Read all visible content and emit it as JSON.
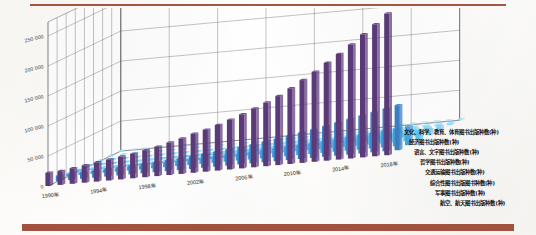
{
  "figure": {
    "title": "",
    "top_rule_color": "#9a4a31",
    "bottom_band_color": "#9e4a33"
  },
  "chart_data": {
    "type": "bar",
    "render": "3d-stacked-depth-bars",
    "title": "",
    "xlabel": "",
    "ylabel": "",
    "ylim": [
      0,
      250000
    ],
    "grid": true,
    "legend_position": "right-overlay",
    "y_ticks": [
      "0",
      "50 000",
      "100 000",
      "150 000",
      "200 000",
      "250 000"
    ],
    "y_tick_values": [
      0,
      50000,
      100000,
      150000,
      200000,
      250000
    ],
    "x_ticks": [
      "1990年",
      "1994年",
      "1998年",
      "2002年",
      "2006年",
      "2010年",
      "2014年",
      "2018年"
    ],
    "categories": [
      "1990年",
      "1991年",
      "1992年",
      "1993年",
      "1994年",
      "1995年",
      "1996年",
      "1997年",
      "1998年",
      "1999年",
      "2000年",
      "2001年",
      "2002年",
      "2003年",
      "2004年",
      "2005年",
      "2006年",
      "2007年",
      "2008年",
      "2009年",
      "2010年",
      "2011年",
      "2012年",
      "2013年",
      "2014年",
      "2015年",
      "2016年",
      "2017年",
      "2018年"
    ],
    "series": [
      {
        "name": "文化、科学、教育、体育图书出版种数(种)",
        "color": "#5c3a7a",
        "depth_index": 0,
        "values": [
          22000,
          23000,
          26000,
          29000,
          32000,
          35000,
          38000,
          41000,
          45000,
          49000,
          54000,
          59000,
          65000,
          70000,
          76000,
          83000,
          90000,
          98000,
          106000,
          115000,
          126000,
          138000,
          150000,
          163000,
          176000,
          190000,
          205000,
          220000,
          236000
        ]
      },
      {
        "name": "经济图书出版种数(种)",
        "color": "#3a7fc4",
        "depth_index": 1,
        "values": [
          9000,
          9500,
          10500,
          11500,
          12500,
          13500,
          14500,
          15500,
          16500,
          18000,
          19500,
          21000,
          23000,
          25000,
          27000,
          29000,
          31500,
          34000,
          37000,
          40000,
          43500,
          47000,
          51000,
          55000,
          59000,
          63000,
          67000,
          71000,
          75000
        ]
      },
      {
        "name": "语言、文字图书出版种数(种)",
        "color": "#4aa3dd",
        "depth_index": 2,
        "values": [
          4000,
          4200,
          4600,
          5000,
          5400,
          5800,
          6200,
          6700,
          7200,
          7800,
          8400,
          9000,
          9800,
          10500,
          11300,
          12200,
          13100,
          14100,
          15200,
          16400,
          17700,
          19100,
          20600,
          22200,
          23900,
          25700,
          27600,
          29600,
          31700
        ]
      },
      {
        "name": "哲学图书出版种数(种)",
        "color": "#5ec5ef",
        "depth_index": 3,
        "values": [
          1800,
          1900,
          2050,
          2200,
          2400,
          2600,
          2800,
          3000,
          3250,
          3500,
          3800,
          4100,
          4450,
          4800,
          5200,
          5600,
          6050,
          6500,
          7000,
          7550,
          8150,
          8800,
          9500,
          10250,
          11050,
          11900,
          12800,
          13750,
          14750
        ]
      },
      {
        "name": "交通运输图书出版种数(种)",
        "color": "#6fcef2",
        "depth_index": 4,
        "values": [
          1200,
          1270,
          1360,
          1460,
          1570,
          1690,
          1820,
          1960,
          2110,
          2270,
          2450,
          2640,
          2850,
          3070,
          3310,
          3570,
          3850,
          4150,
          4470,
          4820,
          5190,
          5590,
          6020,
          6480,
          6970,
          7500,
          8060,
          8660,
          9300
        ]
      },
      {
        "name": "综合性图书出版图书种数(种)",
        "color": "#80d6f5",
        "depth_index": 5,
        "values": [
          900,
          950,
          1020,
          1090,
          1170,
          1260,
          1350,
          1450,
          1560,
          1680,
          1810,
          1950,
          2100,
          2260,
          2440,
          2630,
          2830,
          3050,
          3290,
          3540,
          3820,
          4110,
          4430,
          4770,
          5140,
          5530,
          5950,
          6400,
          6880
        ]
      },
      {
        "name": "军事图书出版种数(种)",
        "color": "#95ddf7",
        "depth_index": 6,
        "values": [
          500,
          525,
          560,
          600,
          640,
          685,
          735,
          785,
          840,
          900,
          965,
          1035,
          1110,
          1190,
          1275,
          1365,
          1465,
          1570,
          1680,
          1800,
          1930,
          2070,
          2220,
          2380,
          2550,
          2730,
          2930,
          3140,
          3360
        ]
      },
      {
        "name": "航空、航天图书出版种数(种)",
        "color": "#a9e4f9",
        "depth_index": 7,
        "values": [
          260,
          272,
          290,
          310,
          330,
          352,
          376,
          400,
          428,
          456,
          488,
          520,
          556,
          594,
          634,
          678,
          724,
          774,
          826,
          882,
          942,
          1006,
          1074,
          1148,
          1226,
          1310,
          1398,
          1494,
          1596
        ]
      }
    ]
  },
  "legend": {
    "items": [
      "文化、科学、教育、体育图书出版种数(种)",
      "经济图书出版种数(种)",
      "语言、文字图书出版种数(种)",
      "哲学图书出版种数(种)",
      "交通运输图书出版种数(种)",
      "综合性图书出版图书种数(种)",
      "军事图书出版种数(种)",
      "航空、航天图书出版种数(种)"
    ]
  }
}
